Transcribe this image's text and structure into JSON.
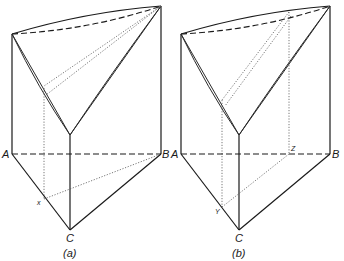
{
  "figures": [
    {
      "id": "a",
      "caption": "(a)",
      "labels": {
        "A": "A",
        "B": "B",
        "C": "C",
        "point": "x"
      }
    },
    {
      "id": "b",
      "caption": "(b)",
      "labels": {
        "A": "A",
        "B": "B",
        "C": "C",
        "point1": "Y",
        "point2": "Z"
      }
    }
  ]
}
